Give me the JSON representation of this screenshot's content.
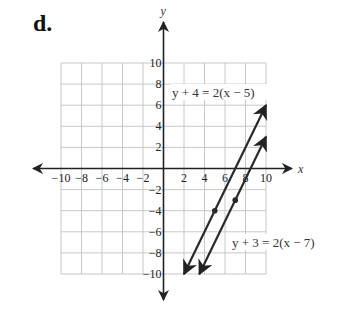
{
  "problem_label": "d.",
  "chart_data": {
    "type": "line",
    "title": "",
    "xlabel": "x",
    "ylabel": "y",
    "xlim": [
      -10,
      10
    ],
    "ylim": [
      -10,
      10
    ],
    "grid": true,
    "grid_step": 2,
    "x_ticks": [
      -10,
      -8,
      -6,
      -4,
      -2,
      2,
      4,
      6,
      8,
      10
    ],
    "y_ticks": [
      10,
      8,
      6,
      4,
      2,
      -2,
      -4,
      -6,
      -8,
      -10
    ],
    "x_tick_labels": [
      "−10",
      "−8",
      "−6",
      "−4",
      "−2",
      "2",
      "4",
      "6",
      "8",
      "10"
    ],
    "y_tick_labels": [
      "10",
      "8",
      "6",
      "4",
      "2",
      "−2",
      "−4",
      "−6",
      "−8",
      "−10"
    ],
    "series": [
      {
        "name": "y + 4 = 2(x − 5)",
        "slope": 2,
        "point": [
          5,
          -4
        ],
        "x": [
          2,
          10
        ],
        "y": [
          -10,
          6
        ],
        "arrows": "both"
      },
      {
        "name": "y + 3 = 2(x − 7)",
        "slope": 2,
        "point": [
          7,
          -3
        ],
        "x": [
          3.5,
          10
        ],
        "y": [
          -10,
          3
        ],
        "arrows": "both"
      }
    ],
    "annotations": [
      {
        "text": "y + 4 = 2(x − 5)",
        "near": [
          6,
          7
        ]
      },
      {
        "text": "y + 3 = 2(x − 7)",
        "near": [
          9,
          -7
        ]
      }
    ]
  }
}
